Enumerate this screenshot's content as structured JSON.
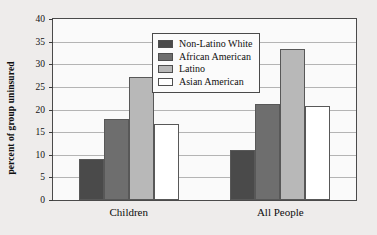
{
  "chart_data": {
    "type": "bar",
    "title": "",
    "xlabel": "",
    "ylabel": "percent of group uninsured",
    "categories": [
      "Children",
      "All People"
    ],
    "series": [
      {
        "name": "Non-Latino White",
        "values": [
          9.0,
          11.1
        ],
        "color": "#4a4a4a"
      },
      {
        "name": "African American",
        "values": [
          18.0,
          21.2
        ],
        "color": "#6e6e6e"
      },
      {
        "name": "Latino",
        "values": [
          27.2,
          33.4
        ],
        "color": "#b8b8b8"
      },
      {
        "name": "Asian American",
        "values": [
          16.8,
          20.8
        ],
        "color": "#ffffff"
      }
    ],
    "ylim": [
      0,
      40
    ],
    "ytick_step": 5,
    "yticks": [
      0,
      5,
      10,
      15,
      20,
      25,
      30,
      35,
      40
    ],
    "ytick_labels": [
      "0",
      "5",
      "10",
      "15",
      "20",
      "25",
      "30",
      "35",
      "40"
    ],
    "grid": true,
    "legend_position": "inside-top-center"
  },
  "legend": {
    "items": [
      {
        "label": "Non-Latino White"
      },
      {
        "label": "African American"
      },
      {
        "label": "Latino"
      },
      {
        "label": "Asian American"
      }
    ]
  },
  "colors": {
    "page_background": "#eeeceb",
    "plot_background": "#fafafa",
    "axis": "#4a4a4a",
    "gridline": "#b4b4b4",
    "text": "#101010"
  }
}
